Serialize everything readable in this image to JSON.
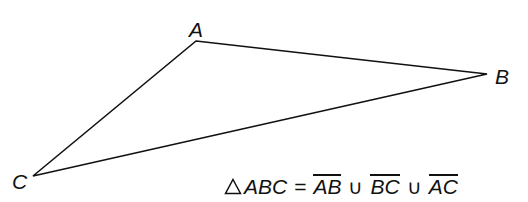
{
  "diagram": {
    "type": "triangle",
    "vertices": [
      {
        "id": "A",
        "label": "A",
        "x": 196,
        "y": 41
      },
      {
        "id": "B",
        "label": "B",
        "x": 487,
        "y": 74
      },
      {
        "id": "C",
        "label": "C",
        "x": 33,
        "y": 176
      }
    ],
    "edges": [
      {
        "from": "A",
        "to": "B"
      },
      {
        "from": "B",
        "to": "C"
      },
      {
        "from": "C",
        "to": "A"
      }
    ],
    "stroke_color": "#111111",
    "background_color": "#ffffff"
  },
  "labels": {
    "a": "A",
    "b": "B",
    "c": "C"
  },
  "equation": {
    "triangle_symbol": "triangle-icon",
    "triangle_name": "ABC",
    "equals": "=",
    "union": "∪",
    "segments": [
      "AB",
      "BC",
      "AC"
    ],
    "full_text": "△ABC = AB ∪ BC ∪ AC"
  }
}
